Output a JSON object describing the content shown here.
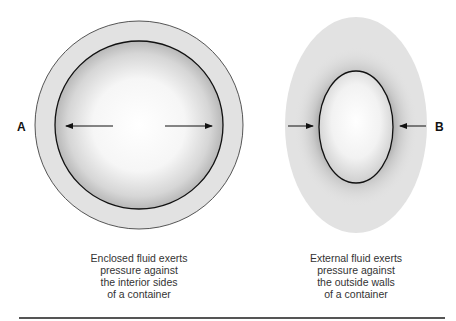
{
  "figure": {
    "panel_a": {
      "label": "A",
      "caption": [
        "Enclosed fluid exerts",
        "pressure against",
        "the interior sides",
        "of a container"
      ],
      "arrow_direction": "outward"
    },
    "panel_b": {
      "label": "B",
      "caption": [
        "External fluid exerts",
        "pressure against",
        "the outside walls",
        "of a container"
      ],
      "arrow_direction": "inward"
    }
  },
  "colors": {
    "outer_fill": "#e2e2e2",
    "shadow": "#8c8c8c",
    "outline": "#111111",
    "rule": "#555555"
  }
}
